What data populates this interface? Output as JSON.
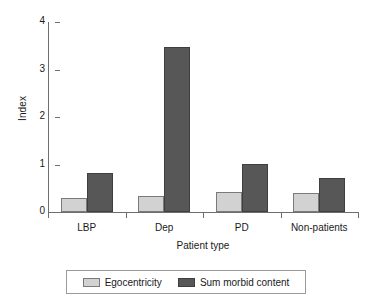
{
  "chart_data": {
    "type": "bar",
    "title": "",
    "xlabel": "Patient type",
    "ylabel": "Index",
    "categories": [
      "LBP",
      "Dep",
      "PD",
      "Non-patients"
    ],
    "series": [
      {
        "name": "Egocentricity",
        "color": "#d2d2d2",
        "values": [
          0.3,
          0.33,
          0.42,
          0.39
        ]
      },
      {
        "name": "Sum morbid content",
        "color": "#575757",
        "values": [
          0.83,
          3.48,
          1.0,
          0.72
        ]
      }
    ],
    "ylim": [
      0,
      4
    ],
    "yticks": [
      "0",
      "1",
      "2",
      "3",
      "4"
    ],
    "ytick_values": [
      0,
      1,
      2,
      3,
      4
    ],
    "grid": false,
    "legend_position": "bottom",
    "legend_boxed": true
  },
  "axis": {
    "y_label": "Index",
    "x_label": "Patient type"
  }
}
